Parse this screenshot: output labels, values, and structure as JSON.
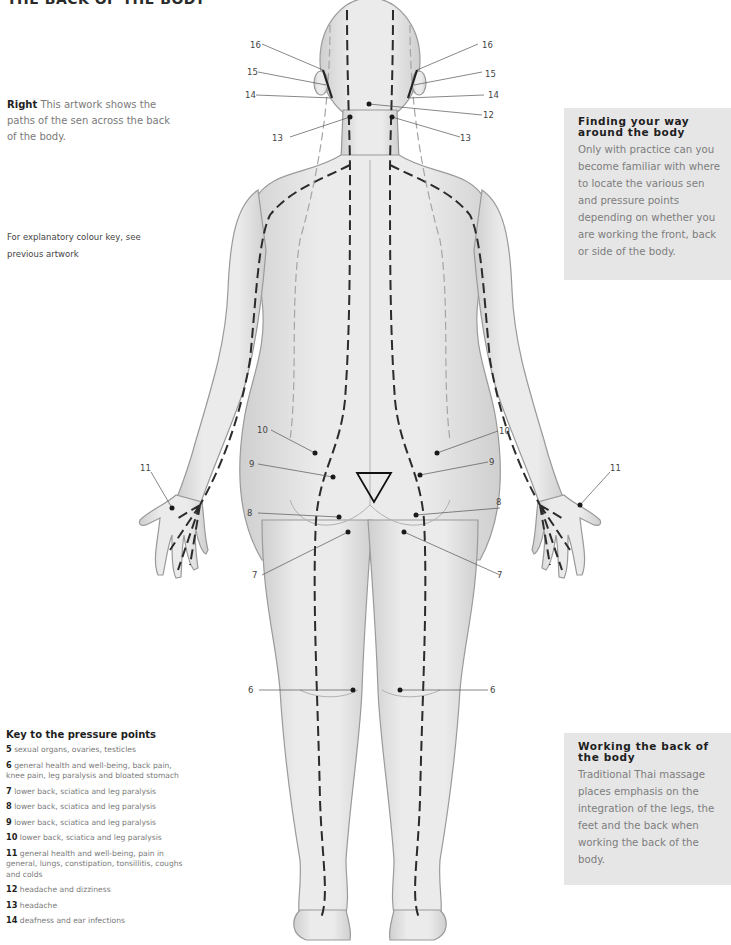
{
  "page": {
    "title": "THE BACK OF THE BODY",
    "caption_lead": "Right",
    "caption_text": "This artwork shows the paths of the sen across the back of the body.",
    "colour_note": "For explanatory colour key, see previous artwork"
  },
  "panels": {
    "finding": {
      "title": "Finding your way around the body",
      "text": "Only with practice can you become familiar with where to locate the various sen and pressure points depending on whether you are working the front, back or side of the body."
    },
    "working": {
      "title": "Working the back of the body",
      "text": "Traditional Thai massage places emphasis on the integration of the legs, the feet and the back when working the back of the body."
    }
  },
  "key": {
    "title": "Key to the pressure points",
    "items": [
      {
        "num": "5",
        "text": "sexual organs, ovaries, testicles"
      },
      {
        "num": "6",
        "text": "general health and well-being, back pain, knee pain, leg paralysis and bloated stomach"
      },
      {
        "num": "7",
        "text": "lower back, sciatica and leg paralysis"
      },
      {
        "num": "8",
        "text": "lower back, sciatica and leg paralysis"
      },
      {
        "num": "9",
        "text": "lower back, sciatica and leg paralysis"
      },
      {
        "num": "10",
        "text": "lower back, sciatica and leg paralysis"
      },
      {
        "num": "11",
        "text": "general health and well-being, pain in general, lungs, constipation, tonsillitis, coughs and colds"
      },
      {
        "num": "12",
        "text": "headache and dizziness"
      },
      {
        "num": "13",
        "text": "headache"
      },
      {
        "num": "14",
        "text": "deafness and ear infections"
      }
    ]
  },
  "figure": {
    "labels": {
      "l16": "16",
      "r16": "16",
      "l15": "15",
      "r15": "15",
      "l14": "14",
      "r14": "14",
      "c12": "12",
      "l13": "13",
      "r13": "13",
      "l10": "10",
      "r10": "10",
      "l9": "9",
      "r9": "9",
      "l8": "8",
      "r8": "8",
      "l7": "7",
      "r7": "7",
      "l11": "11",
      "r11": "11",
      "l6": "6",
      "r6": "6"
    }
  }
}
